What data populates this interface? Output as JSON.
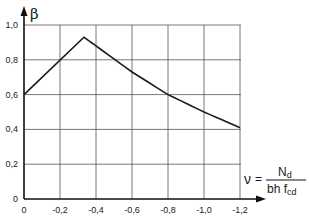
{
  "chart_data": {
    "type": "line",
    "title": "",
    "ylabel": "β",
    "xlabel": "ν = N_d / (b h f_cd)",
    "xlabel_parts": {
      "symbol": "ν",
      "equals": "=",
      "numerator": "N",
      "numerator_sub": "d",
      "denominator": "bh f",
      "denominator_sub": "cd"
    },
    "x_ticks": [
      "0",
      "-0,2",
      "-0,4",
      "-0,6",
      "-0,8",
      "-1,0",
      "-1,2"
    ],
    "y_ticks": [
      "0",
      "0,2",
      "0,4",
      "0,6",
      "0,8",
      "1,0"
    ],
    "xlim": [
      0,
      -1.2
    ],
    "ylim": [
      0,
      1.0
    ],
    "grid": true,
    "legend": null,
    "series": [
      {
        "name": "β",
        "x": [
          0,
          -0.333,
          -0.4,
          -0.6,
          -0.8,
          -1.0,
          -1.2
        ],
        "y": [
          0.6,
          0.93,
          0.88,
          0.73,
          0.6,
          0.5,
          0.41
        ]
      }
    ]
  },
  "colors": {
    "line": "#1a1a1a",
    "grid": "#555555",
    "axis": "#111111"
  }
}
